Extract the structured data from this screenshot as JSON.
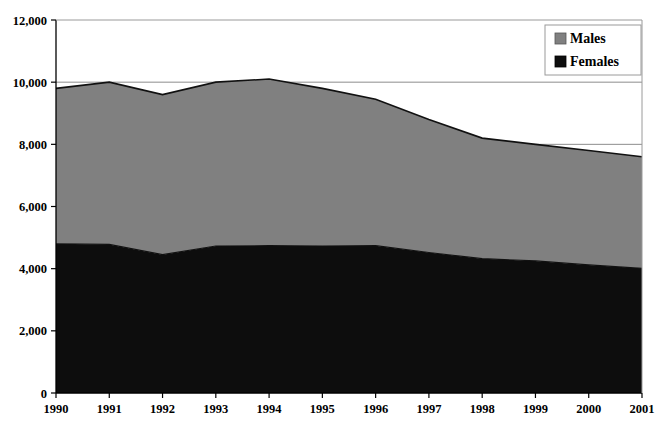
{
  "chart_data": {
    "type": "area",
    "stacked": true,
    "title": "",
    "subtitle": "",
    "xlabel": "",
    "ylabel": "",
    "categories": [
      "1990",
      "1991",
      "1992",
      "1993",
      "1994",
      "1995",
      "1996",
      "1997",
      "1998",
      "1999",
      "2000",
      "2001"
    ],
    "x": [
      1990,
      1991,
      1992,
      1993,
      1994,
      1995,
      1996,
      1997,
      1998,
      1999,
      2000,
      2001
    ],
    "series": [
      {
        "name": "Females",
        "color": "#0d0d0d",
        "values": [
          4800,
          4780,
          4450,
          4730,
          4740,
          4730,
          4740,
          4520,
          4320,
          4250,
          4120,
          4010
        ]
      },
      {
        "name": "Males",
        "color": "#808080",
        "values": [
          5000,
          5220,
          5150,
          5270,
          5360,
          5070,
          4710,
          4280,
          3880,
          3750,
          3680,
          3590
        ]
      }
    ],
    "totals": [
      9800,
      10000,
      9600,
      10000,
      10100,
      9800,
      9450,
      8800,
      8200,
      8000,
      7800,
      7600
    ],
    "ylim": [
      0,
      12000
    ],
    "yticks": [
      0,
      2000,
      4000,
      6000,
      8000,
      10000,
      12000
    ],
    "ytick_labels": [
      "0",
      "2,000",
      "4,000",
      "6,000",
      "8,000",
      "10,000",
      "12,000"
    ],
    "grid": true,
    "gridlines_at": [
      8000,
      10000
    ],
    "legend_position": "top-right",
    "legend": [
      {
        "label": "Males",
        "color": "#808080"
      },
      {
        "label": "Females",
        "color": "#0d0d0d"
      }
    ]
  }
}
